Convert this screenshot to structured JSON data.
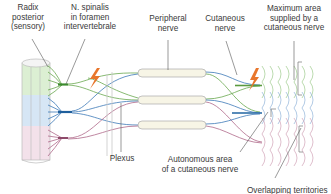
{
  "labels": {
    "radix_posterior": [
      "Radix",
      "posterior",
      "(sensory)"
    ],
    "n_spinalis": [
      "N. spinalis",
      "in foramen",
      "intervertebrale"
    ],
    "peripheral_nerve": [
      "Peripheral",
      "nerve"
    ],
    "cutaneous_nerve": [
      "Cutaneous",
      "nerve"
    ],
    "maximum_area": [
      "Maximum area",
      "supplied by a",
      "cutaneous nerve"
    ],
    "plexus": "Plexus",
    "autonomous_area": [
      "Autonomous area",
      "of a cutaneous nerve"
    ],
    "overlapping": "Overlapping territories"
  },
  "colors": {
    "segment_1": "#6aa84f",
    "segment_2": "#3d7ab8",
    "segment_3": "#b06a8a",
    "cord_green": "#dcefd3",
    "cord_blue": "#d6e6f5",
    "cord_pink": "#f3e1ea",
    "lightning": "#e8762c",
    "nerve_sheath": "#f7f5e6",
    "leader_line": "#555555"
  }
}
